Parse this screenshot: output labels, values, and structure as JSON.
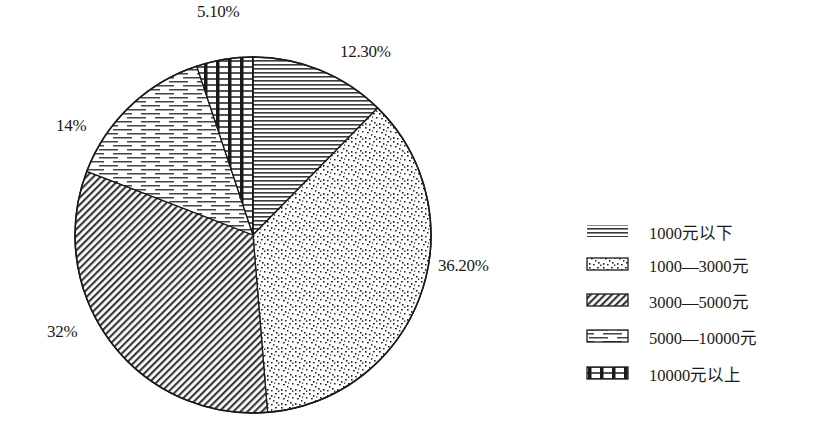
{
  "chart_data": {
    "type": "pie",
    "title": "",
    "categories": [
      "1000元以下",
      "1000—3000元",
      "3000—5000元",
      "5000—10000元",
      "10000元以上"
    ],
    "values": [
      12.3,
      36.2,
      32,
      14,
      5.1
    ],
    "value_labels": [
      "12.30%",
      "36.20%",
      "32%",
      "14%",
      "5.10%"
    ],
    "start_angle_deg": 0,
    "direction": "clockwise",
    "fill_patterns": [
      "horizontal-lines",
      "speckled-dots",
      "diagonal-hatch",
      "dashed-horizontal",
      "vertical-bars-dashes"
    ],
    "legend_position": "right",
    "colors": {
      "ink": "#1a1a1a",
      "background": "#ffffff"
    }
  },
  "labels": {
    "slice_0": "12.30%",
    "slice_1": "36.20%",
    "slice_2": "32%",
    "slice_3": "14%",
    "slice_4": "5.10%"
  },
  "legend": {
    "items": [
      {
        "label": "1000元以下",
        "pattern": "horizontal-lines"
      },
      {
        "label": "1000—3000元",
        "pattern": "speckled-dots"
      },
      {
        "label": "3000—5000元",
        "pattern": "diagonal-hatch"
      },
      {
        "label": "5000—10000元",
        "pattern": "dashed-horizontal"
      },
      {
        "label": "10000元以上",
        "pattern": "vertical-bars-dashes"
      }
    ]
  }
}
